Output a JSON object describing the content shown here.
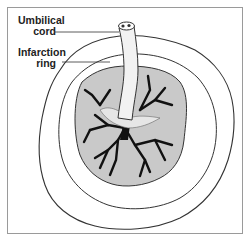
{
  "figure": {
    "labels": [
      {
        "line1": "Umbilical",
        "line2": "cord"
      },
      {
        "line1": "Infarction",
        "line2": "ring"
      }
    ],
    "colors": {
      "frame": "#9a9a9a",
      "outline": "#333333",
      "placenta_fill": "#c9c9c9",
      "vessels": "#111111",
      "membrane": "#ffffff"
    }
  }
}
